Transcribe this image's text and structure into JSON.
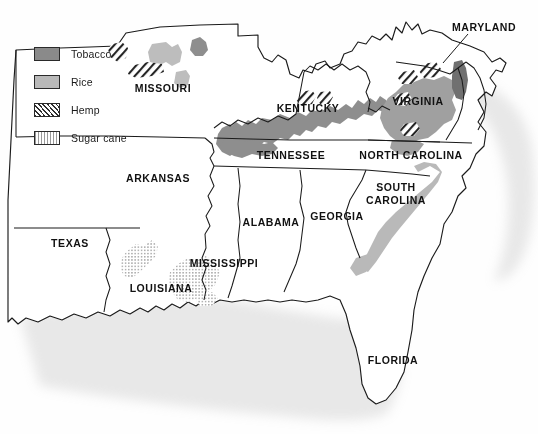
{
  "map": {
    "title": "Agricultural crop regions of the American South",
    "legend": {
      "name": "crop-legend",
      "items": [
        {
          "label": "Tobacco",
          "pattern": "solid-dark-gray",
          "color": "#8a8a8a",
          "swatch_class": "sw-tobacco"
        },
        {
          "label": "Rice",
          "pattern": "solid-light-gray",
          "color": "#b9b9b9",
          "swatch_class": "sw-rice"
        },
        {
          "label": "Hemp",
          "pattern": "diagonal-hatch",
          "color": "#2f2f2f",
          "swatch_class": "sw-hemp"
        },
        {
          "label": "Sugar cane",
          "pattern": "fine-stipple",
          "color": "#9a9a9a",
          "swatch_class": "sw-sugar"
        }
      ]
    },
    "state_labels": [
      {
        "name": "label-missouri",
        "text": "MISSOURI",
        "x": 163,
        "y": 88,
        "lines": [
          "MISSOURI"
        ]
      },
      {
        "name": "label-arkansas",
        "text": "ARKANSAS",
        "x": 158,
        "y": 178,
        "lines": [
          "ARKANSAS"
        ]
      },
      {
        "name": "label-texas",
        "text": "TEXAS",
        "x": 70,
        "y": 243,
        "lines": [
          "TEXAS"
        ]
      },
      {
        "name": "label-louisiana",
        "text": "LOUISIANA",
        "x": 161,
        "y": 288,
        "lines": [
          "LOUISIANA"
        ]
      },
      {
        "name": "label-mississippi",
        "text": "MISSISSIPPI",
        "x": 224,
        "y": 263,
        "lines": [
          "MISSISSIPPI"
        ]
      },
      {
        "name": "label-alabama",
        "text": "ALABAMA",
        "x": 271,
        "y": 222,
        "lines": [
          "ALABAMA"
        ]
      },
      {
        "name": "label-georgia",
        "text": "GEORGIA",
        "x": 337,
        "y": 216,
        "lines": [
          "GEORGIA"
        ]
      },
      {
        "name": "label-florida",
        "text": "FLORIDA",
        "x": 393,
        "y": 360,
        "lines": [
          "FLORIDA"
        ]
      },
      {
        "name": "label-tennessee",
        "text": "TENNESSEE",
        "x": 291,
        "y": 155,
        "lines": [
          "TENNESSEE"
        ]
      },
      {
        "name": "label-kentucky",
        "text": "KENTUCKY",
        "x": 308,
        "y": 108,
        "lines": [
          "KENTUCKY"
        ]
      },
      {
        "name": "label-virginia",
        "text": "VIRGINIA",
        "x": 418,
        "y": 101,
        "lines": [
          "VIRGINIA"
        ]
      },
      {
        "name": "label-north-carolina",
        "text": "NORTH CAROLINA",
        "x": 411,
        "y": 155,
        "lines": [
          "NORTH CAROLINA"
        ]
      },
      {
        "name": "label-south-carolina",
        "text": "SOUTH CAROLINA",
        "x": 396,
        "y": 193,
        "lines": [
          "SOUTH",
          "CAROLINA"
        ]
      },
      {
        "name": "label-maryland",
        "text": "MARYLAND",
        "x": 484,
        "y": 27,
        "lines": [
          "MARYLAND"
        ]
      }
    ],
    "leader_lines": [
      {
        "name": "maryland-leader-line",
        "x1": 468,
        "y1": 34,
        "x2": 443,
        "y2": 63
      }
    ],
    "crop_regions": [
      {
        "name": "region-tobacco-kentucky",
        "crop": "Tobacco",
        "state": "Kentucky"
      },
      {
        "name": "region-tobacco-tennessee",
        "crop": "Tobacco",
        "state": "Tennessee"
      },
      {
        "name": "region-tobacco-virginia",
        "crop": "Tobacco",
        "state": "Virginia"
      },
      {
        "name": "region-tobacco-north-carolina",
        "crop": "Tobacco",
        "state": "North Carolina"
      },
      {
        "name": "region-tobacco-maryland",
        "crop": "Tobacco",
        "state": "Maryland"
      },
      {
        "name": "region-tobacco-missouri",
        "crop": "Tobacco",
        "state": "Missouri"
      },
      {
        "name": "region-rice-missouri",
        "crop": "Rice",
        "state": "Missouri"
      },
      {
        "name": "region-rice-south-carolina",
        "crop": "Rice",
        "state": "South Carolina"
      },
      {
        "name": "region-rice-georgia-coast",
        "crop": "Rice",
        "state": "Georgia"
      },
      {
        "name": "region-hemp-missouri",
        "crop": "Hemp",
        "state": "Missouri"
      },
      {
        "name": "region-hemp-kentucky",
        "crop": "Hemp",
        "state": "Kentucky"
      },
      {
        "name": "region-hemp-virginia",
        "crop": "Hemp",
        "state": "Virginia"
      },
      {
        "name": "region-sugar-louisiana-north",
        "crop": "Sugar cane",
        "state": "Louisiana"
      },
      {
        "name": "region-sugar-louisiana-delta",
        "crop": "Sugar cane",
        "state": "Louisiana"
      }
    ]
  }
}
